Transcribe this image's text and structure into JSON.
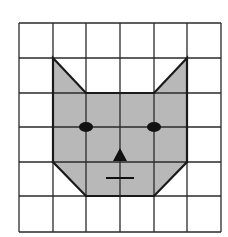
{
  "figure": {
    "grid": {
      "columns": 6,
      "rows": 6,
      "x_lines": [
        19,
        53,
        86,
        120,
        154,
        187,
        221
      ],
      "y_lines": [
        23,
        58,
        93,
        127,
        162,
        196,
        232
      ],
      "line_color": "#2a2a2a"
    },
    "cat_face": {
      "fill_color": "#b8b8b8",
      "outline_color": "#1a1a1a",
      "points": "53,58 86,93 154,93 187,58 187,162 154,196 86,196 53,162"
    },
    "features": {
      "left_eye": {
        "cx": 86,
        "cy": 127,
        "rx": 7,
        "ry": 5
      },
      "right_eye": {
        "cx": 154,
        "cy": 127,
        "rx": 7,
        "ry": 5
      },
      "nose": {
        "points": "120,148 113,161 127,161"
      },
      "mouth": {
        "x1": 106,
        "y1": 178,
        "x2": 134,
        "y2": 178
      }
    }
  }
}
